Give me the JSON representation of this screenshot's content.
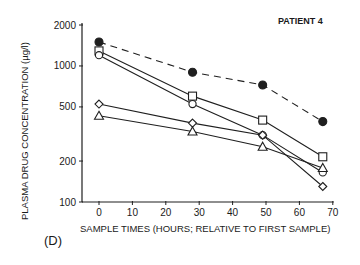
{
  "chart_data": {
    "type": "line",
    "title": "PATIENT 4",
    "panel_label": "(D)",
    "xlabel": "SAMPLE TIMES (HOURS; RELATIVE TO FIRST SAMPLE)",
    "ylabel": "PLASMA DRUG CONCENTRATION (µg/l)",
    "yscale": "log",
    "xlim": [
      -5,
      70
    ],
    "ylim": [
      100,
      2000
    ],
    "xticks": [
      0,
      10,
      20,
      30,
      40,
      50,
      60,
      70
    ],
    "yticks": [
      100,
      200,
      500,
      1000,
      2000
    ],
    "grid": false,
    "legend": "none",
    "x": [
      0,
      28,
      49,
      67
    ],
    "series": [
      {
        "name": "filled-circle",
        "marker": "filled-circle",
        "line": "dashed",
        "values": [
          1500,
          900,
          725,
          390
        ]
      },
      {
        "name": "square",
        "marker": "square",
        "line": "solid",
        "values": [
          1290,
          600,
          400,
          215
        ]
      },
      {
        "name": "open-circle",
        "marker": "circle",
        "line": "solid",
        "values": [
          1200,
          525,
          310,
          165
        ]
      },
      {
        "name": "diamond",
        "marker": "diamond",
        "line": "solid",
        "values": [
          525,
          380,
          310,
          130
        ]
      },
      {
        "name": "triangle",
        "marker": "triangle",
        "line": "solid",
        "values": [
          430,
          330,
          255,
          178
        ]
      }
    ]
  }
}
